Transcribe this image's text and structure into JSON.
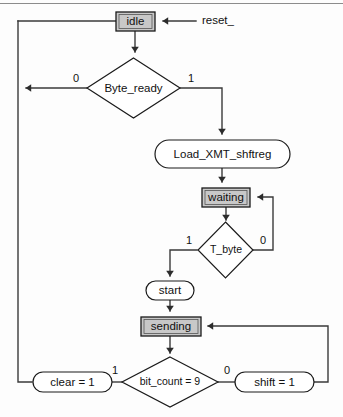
{
  "diagram": {
    "type": "flowchart",
    "colors": {
      "state_fill": "#c8c8c8",
      "action_fill": "#ffffff",
      "decision_fill": "#ffffff",
      "line": "#3a3a3a",
      "border": "#1b1b1b",
      "background": "#fdfdfd"
    },
    "states": [
      {
        "id": "idle",
        "label": "idle",
        "shape": "rectangle",
        "fill": "gray"
      },
      {
        "id": "waiting",
        "label": "waiting",
        "shape": "rectangle",
        "fill": "gray"
      },
      {
        "id": "sending",
        "label": "sending",
        "shape": "rectangle",
        "fill": "gray"
      }
    ],
    "actions": [
      {
        "id": "load_xmt_shftreg",
        "label": "Load_XMT_shftreg",
        "shape": "rounded"
      },
      {
        "id": "start",
        "label": "start",
        "shape": "rounded"
      },
      {
        "id": "clear",
        "label": "clear = 1",
        "shape": "rounded"
      },
      {
        "id": "shift",
        "label": "shift = 1",
        "shape": "rounded"
      }
    ],
    "decisions": [
      {
        "id": "byte_ready",
        "label": "Byte_ready",
        "shape": "diamond",
        "branch_true": "1",
        "branch_false": "0"
      },
      {
        "id": "t_byte",
        "label": "T_byte",
        "shape": "diamond",
        "branch_true": "1",
        "branch_false": "0"
      },
      {
        "id": "bit_count",
        "label": "bit_count = 9",
        "shape": "diamond",
        "branch_true": "1",
        "branch_false": "0"
      }
    ],
    "inputs": [
      {
        "id": "reset",
        "label": "reset_",
        "target": "idle"
      }
    ],
    "branch_labels": {
      "byte_ready_zero": "0",
      "byte_ready_one": "1",
      "t_byte_one": "1",
      "t_byte_zero": "0",
      "bit_count_one": "1",
      "bit_count_zero": "0"
    }
  }
}
